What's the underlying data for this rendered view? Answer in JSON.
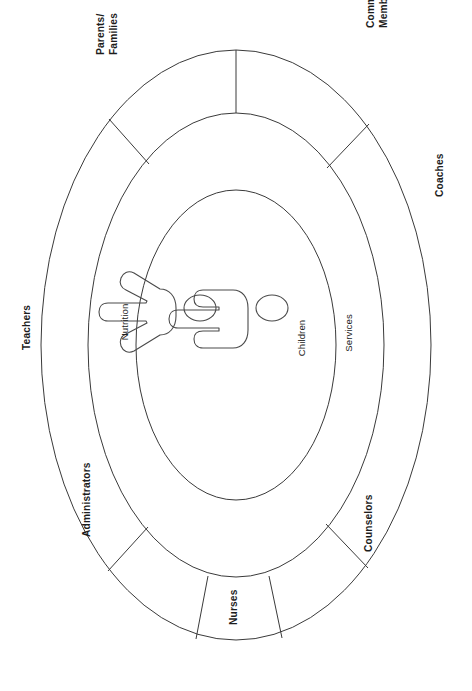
{
  "diagram": {
    "orientation": "rotated-90-counterclockwise",
    "center_icon": "two-people-icon",
    "stroke_color": "#3a3a3a",
    "background_color": "#ffffff",
    "rings": [
      {
        "name": "core",
        "label": "Children",
        "segments": 1
      },
      {
        "name": "inner-ring",
        "labels": [
          "Nutrition",
          "Services"
        ],
        "segments": 2
      },
      {
        "name": "outer-ring",
        "labels": [
          "Parents/ Families",
          "Community Members",
          "Coaches",
          "Counselors",
          "Nurses",
          "Administrators",
          "Teachers"
        ],
        "segments": 7
      }
    ],
    "labels": {
      "core": "Children",
      "nutrition": "Nutrition",
      "services": "Services",
      "parents_families_line1": "Parents/",
      "parents_families_line2": "Families",
      "community_members_line1": "Community",
      "community_members_line2": "Members",
      "coaches": "Coaches",
      "counselors": "Counselors",
      "nurses": "Nurses",
      "administrators": "Administrators",
      "teachers": "Teachers"
    },
    "caption": ""
  }
}
